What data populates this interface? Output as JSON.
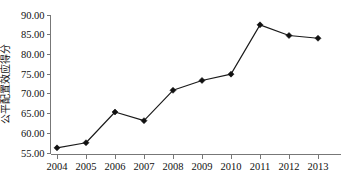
{
  "chart_data": {
    "type": "line",
    "title": "",
    "xlabel": "",
    "ylabel": "公平配置效应得分",
    "categories": [
      "2004",
      "2005",
      "2006",
      "2007",
      "2008",
      "2009",
      "2010",
      "2011",
      "2012",
      "2013"
    ],
    "values": [
      56.3,
      57.6,
      65.4,
      63.2,
      70.9,
      73.4,
      75.0,
      87.5,
      84.8,
      84.1
    ],
    "series": [
      {
        "name": "公平配置效应得分",
        "values": [
          56.3,
          57.6,
          65.4,
          63.2,
          70.9,
          73.4,
          75.0,
          87.5,
          84.8,
          84.1
        ]
      }
    ],
    "ylim": [
      55.0,
      90.0
    ],
    "ytick_labels": [
      "90.00",
      "85.00",
      "80.00",
      "75.00",
      "70.00",
      "65.00",
      "60.00",
      "55.00"
    ],
    "ytick_values": [
      90.0,
      85.0,
      80.0,
      75.0,
      70.0,
      65.0,
      60.0,
      55.0
    ],
    "xtick_labels": [
      "2004",
      "2005",
      "2006",
      "2007",
      "2008",
      "2009",
      "2010",
      "2011",
      "2012",
      "2013"
    ],
    "grid": false,
    "legend": false,
    "legend_position": "none",
    "marker": "diamond",
    "line_color": "#1a1a1a",
    "marker_color": "#111111",
    "axis_color": "#777777",
    "background_color": "#ffffff"
  }
}
